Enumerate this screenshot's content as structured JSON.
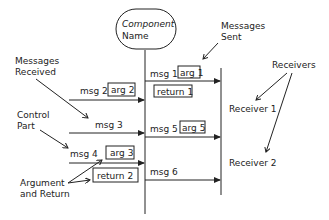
{
  "component": {
    "line1": "Component",
    "line2": "Name"
  },
  "annotations": {
    "messages_sent": [
      "Messages",
      "Sent"
    ],
    "messages_received": [
      "Messages",
      "Received"
    ],
    "receivers": "Receivers",
    "control_part": [
      "Control",
      "Part"
    ],
    "argument_return": [
      "Argument",
      "and Return"
    ]
  },
  "incoming": [
    {
      "msg": "msg 2",
      "arg": "arg 2"
    },
    {
      "msg": "msg 3"
    },
    {
      "msg": "msg 4",
      "arg": "arg 3",
      "ret": "return 2"
    }
  ],
  "outgoing": [
    {
      "msg": "msg 1",
      "arg": "arg 1",
      "ret": "return 1"
    },
    {
      "msg": "msg 5",
      "arg": "arg 5"
    },
    {
      "msg": "msg 6"
    }
  ],
  "receivers": [
    "Receiver 1",
    "Receiver 2"
  ]
}
